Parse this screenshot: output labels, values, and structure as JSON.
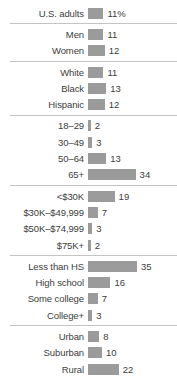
{
  "chart_data": {
    "type": "bar",
    "orientation": "horizontal",
    "value_unit": "%",
    "px_per_unit": 1.4,
    "bar_color": "#9b9b9b",
    "text_color": "#3d3d3d",
    "divider_color": "#c4c4c4",
    "xlim": [
      0,
      50
    ],
    "grid": false,
    "legend": false,
    "groups": [
      {
        "name": "total",
        "rows": [
          {
            "label": "U.S. adults",
            "value": 11,
            "display": "11%"
          }
        ]
      },
      {
        "name": "gender",
        "rows": [
          {
            "label": "Men",
            "value": 11,
            "display": "11"
          },
          {
            "label": "Women",
            "value": 12,
            "display": "12"
          }
        ]
      },
      {
        "name": "race-ethnicity",
        "rows": [
          {
            "label": "White",
            "value": 11,
            "display": "11"
          },
          {
            "label": "Black",
            "value": 13,
            "display": "13"
          },
          {
            "label": "Hispanic",
            "value": 12,
            "display": "12"
          }
        ]
      },
      {
        "name": "age",
        "rows": [
          {
            "label": "18–29",
            "value": 2,
            "display": "2"
          },
          {
            "label": "30–49",
            "value": 3,
            "display": "3"
          },
          {
            "label": "50–64",
            "value": 13,
            "display": "13"
          },
          {
            "label": "65+",
            "value": 34,
            "display": "34"
          }
        ]
      },
      {
        "name": "income",
        "rows": [
          {
            "label": "<$30K",
            "value": 19,
            "display": "19"
          },
          {
            "label": "$30K–$49,999",
            "value": 7,
            "display": "7"
          },
          {
            "label": "$50K–$74,999",
            "value": 3,
            "display": "3"
          },
          {
            "label": "$75K+",
            "value": 2,
            "display": "2"
          }
        ]
      },
      {
        "name": "education",
        "rows": [
          {
            "label": "Less than HS",
            "value": 35,
            "display": "35"
          },
          {
            "label": "High school",
            "value": 16,
            "display": "16"
          },
          {
            "label": "Some college",
            "value": 7,
            "display": "7"
          },
          {
            "label": "College+",
            "value": 3,
            "display": "3"
          }
        ]
      },
      {
        "name": "community-type",
        "rows": [
          {
            "label": "Urban",
            "value": 8,
            "display": "8"
          },
          {
            "label": "Suburban",
            "value": 10,
            "display": "10"
          },
          {
            "label": "Rural",
            "value": 22,
            "display": "22"
          }
        ]
      }
    ]
  }
}
